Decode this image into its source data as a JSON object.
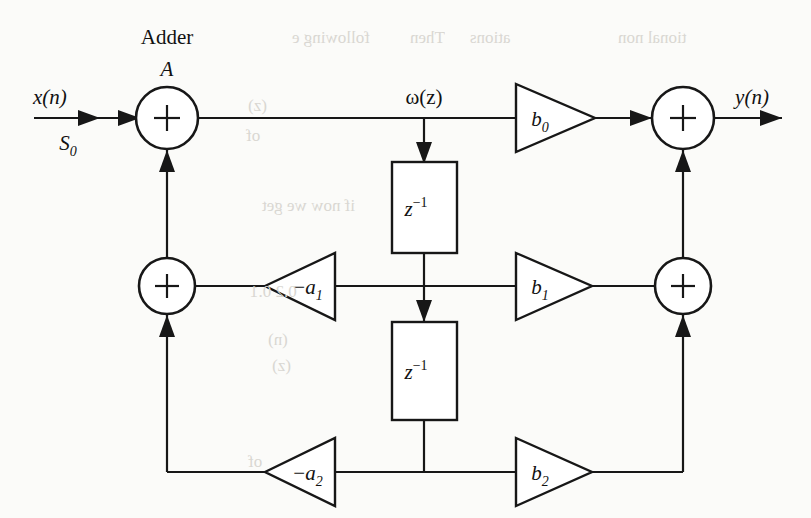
{
  "figure": {
    "kind": "signal-flow-graph",
    "background_color": "#fbfbf9",
    "line_color": "#171717"
  },
  "labels": {
    "adder_title": "Adder",
    "adder_name": "A",
    "input_signal": "x(n)",
    "input_state_base": "S",
    "input_state_sub": "0",
    "intermediate_signal": "ω(z)",
    "output_signal": "y(n)"
  },
  "delays": [
    {
      "id": "delay-1",
      "base": "z",
      "exponent": "−1"
    },
    {
      "id": "delay-2",
      "base": "z",
      "exponent": "−1"
    }
  ],
  "gains": [
    {
      "id": "gain-b0",
      "base": "b",
      "sub": "0",
      "sign": "",
      "direction": "right"
    },
    {
      "id": "gain-b1",
      "base": "b",
      "sub": "1",
      "sign": "",
      "direction": "right"
    },
    {
      "id": "gain-b2",
      "base": "b",
      "sub": "2",
      "sign": "",
      "direction": "right"
    },
    {
      "id": "gain-a1",
      "base": "a",
      "sub": "1",
      "sign": "−",
      "direction": "left"
    },
    {
      "id": "gain-a2",
      "base": "a",
      "sub": "2",
      "sign": "−",
      "direction": "left"
    }
  ],
  "adders": [
    {
      "id": "adder-A",
      "glyph": "+",
      "row": "top",
      "side": "left"
    },
    {
      "id": "adder-out-top",
      "glyph": "+",
      "row": "top",
      "side": "right"
    },
    {
      "id": "adder-fb-mid",
      "glyph": "+",
      "row": "middle",
      "side": "left"
    },
    {
      "id": "adder-out-mid",
      "glyph": "+",
      "row": "middle",
      "side": "right"
    }
  ],
  "bleed_through": [
    {
      "text": "tional non",
      "x": 618,
      "y": 28
    },
    {
      "text": "following e",
      "x": 292,
      "y": 28
    },
    {
      "text": "Then",
      "x": 410,
      "y": 28
    },
    {
      "text": "ations",
      "x": 470,
      "y": 28
    },
    {
      "text": "(z)",
      "x": 248,
      "y": 96
    },
    {
      "text": "of",
      "x": 246,
      "y": 126
    },
    {
      "text": "if now we get",
      "x": 262,
      "y": 196
    },
    {
      "text": "0.2 0.1",
      "x": 250,
      "y": 282
    },
    {
      "text": "(n)",
      "x": 268,
      "y": 330
    },
    {
      "text": "(z)",
      "x": 272,
      "y": 356
    },
    {
      "text": "of",
      "x": 248,
      "y": 452
    }
  ]
}
